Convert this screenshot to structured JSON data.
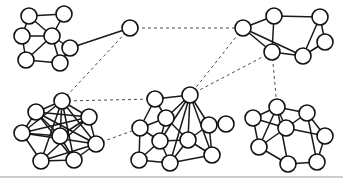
{
  "figure": {
    "background_color": "#ffffff",
    "width": 343,
    "height": 187,
    "node_fill": "#ffffff",
    "node_stroke": "#111111",
    "node_radius": 8,
    "intra_edge_color": "#1a1a1a",
    "inter_edge_color": "#4d4d4d",
    "rule_color": "#9a9a9a",
    "rule_y": 177
  },
  "chart_data": {
    "type": "diagram",
    "xlabel": "",
    "ylabel": "",
    "grid": false,
    "legend": false,
    "cluster_count": 5,
    "node_count": 39,
    "clusters": [
      {
        "id": "cluster-top-left",
        "label": "top-left cluster",
        "node_count": 6,
        "nodes": [
          {
            "id": "tl1",
            "x": 29,
            "y": 16
          },
          {
            "id": "tl2",
            "x": 64,
            "y": 14
          },
          {
            "id": "tl3",
            "x": 22,
            "y": 36
          },
          {
            "id": "tl4",
            "x": 52,
            "y": 36
          },
          {
            "id": "tl5",
            "x": 70,
            "y": 48
          },
          {
            "id": "tl6",
            "x": 26,
            "y": 60
          },
          {
            "id": "tl7",
            "x": 60,
            "y": 63
          }
        ],
        "edges": [
          [
            "tl1",
            "tl2"
          ],
          [
            "tl1",
            "tl3"
          ],
          [
            "tl1",
            "tl4"
          ],
          [
            "tl2",
            "tl4"
          ],
          [
            "tl3",
            "tl4"
          ],
          [
            "tl3",
            "tl6"
          ],
          [
            "tl4",
            "tl5"
          ],
          [
            "tl4",
            "tl6"
          ],
          [
            "tl4",
            "tl7"
          ],
          [
            "tl5",
            "tl7"
          ],
          [
            "tl6",
            "tl7"
          ]
        ]
      },
      {
        "id": "hub",
        "label": "bridge hub node",
        "node_count": 1,
        "nodes": [
          {
            "id": "hub1",
            "x": 130,
            "y": 28
          }
        ],
        "edges": []
      },
      {
        "id": "cluster-top-right",
        "label": "top-right cluster",
        "node_count": 7,
        "nodes": [
          {
            "id": "tr1",
            "x": 243,
            "y": 28
          },
          {
            "id": "tr2",
            "x": 274,
            "y": 16
          },
          {
            "id": "tr3",
            "x": 320,
            "y": 17
          },
          {
            "id": "tr4",
            "x": 272,
            "y": 52
          },
          {
            "id": "tr5",
            "x": 325,
            "y": 42
          },
          {
            "id": "tr6",
            "x": 303,
            "y": 56
          }
        ],
        "edges": [
          [
            "tr1",
            "tr2"
          ],
          [
            "tr1",
            "tr4"
          ],
          [
            "tr1",
            "tr6"
          ],
          [
            "tr2",
            "tr3"
          ],
          [
            "tr2",
            "tr4"
          ],
          [
            "tr3",
            "tr5"
          ],
          [
            "tr3",
            "tr6"
          ],
          [
            "tr4",
            "tr6"
          ],
          [
            "tr5",
            "tr6"
          ]
        ]
      },
      {
        "id": "cluster-bottom-left",
        "label": "bottom-left cluster",
        "node_count": 7,
        "nodes": [
          {
            "id": "bl1",
            "x": 62,
            "y": 101
          },
          {
            "id": "bl2",
            "x": 36,
            "y": 112
          },
          {
            "id": "bl3",
            "x": 89,
            "y": 117
          },
          {
            "id": "bl4",
            "x": 22,
            "y": 133
          },
          {
            "id": "bl5",
            "x": 96,
            "y": 144
          },
          {
            "id": "bl6",
            "x": 41,
            "y": 161
          },
          {
            "id": "bl7",
            "x": 74,
            "y": 160
          },
          {
            "id": "bl8",
            "x": 60,
            "y": 136
          }
        ],
        "edges": [
          [
            "bl1",
            "bl2"
          ],
          [
            "bl1",
            "bl3"
          ],
          [
            "bl1",
            "bl4"
          ],
          [
            "bl1",
            "bl5"
          ],
          [
            "bl1",
            "bl6"
          ],
          [
            "bl1",
            "bl7"
          ],
          [
            "bl1",
            "bl8"
          ],
          [
            "bl2",
            "bl3"
          ],
          [
            "bl2",
            "bl4"
          ],
          [
            "bl2",
            "bl5"
          ],
          [
            "bl2",
            "bl7"
          ],
          [
            "bl2",
            "bl8"
          ],
          [
            "bl3",
            "bl4"
          ],
          [
            "bl3",
            "bl5"
          ],
          [
            "bl3",
            "bl6"
          ],
          [
            "bl3",
            "bl8"
          ],
          [
            "bl4",
            "bl5"
          ],
          [
            "bl4",
            "bl6"
          ],
          [
            "bl4",
            "bl8"
          ],
          [
            "bl5",
            "bl6"
          ],
          [
            "bl5",
            "bl7"
          ],
          [
            "bl6",
            "bl7"
          ],
          [
            "bl7",
            "bl8"
          ]
        ]
      },
      {
        "id": "cluster-middle",
        "label": "middle-bottom cluster",
        "node_count": 11,
        "nodes": [
          {
            "id": "mc1",
            "x": 155,
            "y": 99
          },
          {
            "id": "mc2",
            "x": 190,
            "y": 95
          },
          {
            "id": "mc3",
            "x": 166,
            "y": 118
          },
          {
            "id": "mc4",
            "x": 140,
            "y": 128
          },
          {
            "id": "mc5",
            "x": 209,
            "y": 125
          },
          {
            "id": "mc6",
            "x": 226,
            "y": 124
          },
          {
            "id": "mc7",
            "x": 160,
            "y": 141
          },
          {
            "id": "mc8",
            "x": 188,
            "y": 140
          },
          {
            "id": "mc9",
            "x": 139,
            "y": 160
          },
          {
            "id": "mc10",
            "x": 170,
            "y": 163
          },
          {
            "id": "mc11",
            "x": 212,
            "y": 155
          }
        ],
        "edges": [
          [
            "mc1",
            "mc2"
          ],
          [
            "mc1",
            "mc3"
          ],
          [
            "mc1",
            "mc4"
          ],
          [
            "mc2",
            "mc3"
          ],
          [
            "mc2",
            "mc5"
          ],
          [
            "mc2",
            "mc7"
          ],
          [
            "mc2",
            "mc8"
          ],
          [
            "mc2",
            "mc10"
          ],
          [
            "mc3",
            "mc4"
          ],
          [
            "mc3",
            "mc7"
          ],
          [
            "mc3",
            "mc8"
          ],
          [
            "mc4",
            "mc7"
          ],
          [
            "mc4",
            "mc9"
          ],
          [
            "mc5",
            "mc6"
          ],
          [
            "mc5",
            "mc8"
          ],
          [
            "mc5",
            "mc11"
          ],
          [
            "mc7",
            "mc8"
          ],
          [
            "mc7",
            "mc9"
          ],
          [
            "mc7",
            "mc10"
          ],
          [
            "mc8",
            "mc10"
          ],
          [
            "mc8",
            "mc11"
          ],
          [
            "mc9",
            "mc10"
          ],
          [
            "mc10",
            "mc11"
          ],
          [
            "mc2",
            "mc11"
          ]
        ]
      },
      {
        "id": "cluster-bottom-right",
        "label": "bottom-right cluster",
        "node_count": 8,
        "nodes": [
          {
            "id": "br1",
            "x": 277,
            "y": 107
          },
          {
            "id": "br2",
            "x": 253,
            "y": 118
          },
          {
            "id": "br3",
            "x": 307,
            "y": 113
          },
          {
            "id": "br4",
            "x": 286,
            "y": 128
          },
          {
            "id": "br5",
            "x": 325,
            "y": 136
          },
          {
            "id": "br6",
            "x": 259,
            "y": 147
          },
          {
            "id": "br7",
            "x": 288,
            "y": 164
          },
          {
            "id": "br8",
            "x": 317,
            "y": 162
          }
        ],
        "edges": [
          [
            "br1",
            "br2"
          ],
          [
            "br1",
            "br3"
          ],
          [
            "br1",
            "br4"
          ],
          [
            "br1",
            "br6"
          ],
          [
            "br1",
            "br7"
          ],
          [
            "br2",
            "br4"
          ],
          [
            "br2",
            "br6"
          ],
          [
            "br3",
            "br4"
          ],
          [
            "br3",
            "br8"
          ],
          [
            "br4",
            "br5"
          ],
          [
            "br4",
            "br6"
          ],
          [
            "br5",
            "br8"
          ],
          [
            "br6",
            "br7"
          ],
          [
            "br7",
            "br8"
          ],
          [
            "br3",
            "br5"
          ]
        ]
      }
    ],
    "inter_cluster_edges": [
      {
        "from": "tl5",
        "to": "hub1",
        "style": "solid"
      },
      {
        "from": "hub1",
        "to": "tr1",
        "style": "dashed"
      },
      {
        "from": "hub1",
        "to": "bl1",
        "style": "dashed"
      },
      {
        "from": "tr1",
        "to": "mc2",
        "style": "dashed"
      },
      {
        "from": "tr4",
        "to": "mc2",
        "style": "dashed"
      },
      {
        "from": "tr4",
        "to": "br1",
        "style": "dashed"
      },
      {
        "from": "bl5",
        "to": "mc4",
        "style": "dashed"
      },
      {
        "from": "bl1",
        "to": "mc1",
        "style": "dashed"
      }
    ]
  }
}
